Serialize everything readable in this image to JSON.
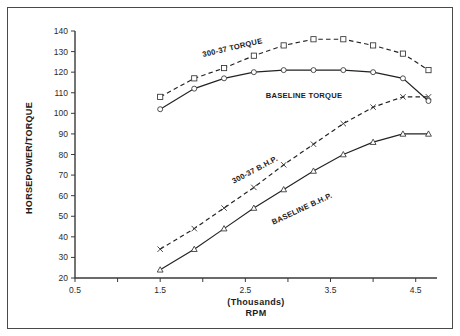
{
  "chart_data": {
    "type": "line",
    "title": "",
    "xlabel": "(Thousands)\nRPM",
    "xlabel_line1": "(Thousands)",
    "xlabel_line2": "RPM",
    "ylabel": "HORSEPOWER/TORQUE",
    "xlim": [
      0.5,
      4.75
    ],
    "ylim": [
      20,
      140
    ],
    "xticks": [
      0.5,
      1.0,
      1.5,
      2.0,
      2.5,
      3.0,
      3.5,
      4.0,
      4.5
    ],
    "xticklabels": [
      "0.5",
      "",
      "1.5",
      "",
      "2.5",
      "",
      "3.5",
      "",
      "4.5"
    ],
    "yticks": [
      20,
      30,
      40,
      50,
      60,
      70,
      80,
      90,
      100,
      110,
      120,
      130,
      140
    ],
    "yticklabels": [
      "20",
      "30",
      "40",
      "50",
      "60",
      "70",
      "80",
      "90",
      "100",
      "110",
      "120",
      "130",
      "140"
    ],
    "grid": false,
    "legend": "inline-annotations",
    "series": [
      {
        "name": "300-37 TORQUE",
        "label": "300-37 TORQUE",
        "style": "dashed",
        "marker": "square",
        "x": [
          1.5,
          1.9,
          2.25,
          2.6,
          2.95,
          3.3,
          3.65,
          4.0,
          4.35,
          4.65
        ],
        "values": [
          108,
          117,
          122,
          128,
          133,
          136,
          136,
          133,
          129,
          121
        ]
      },
      {
        "name": "BASELINE TORQUE",
        "label": "BASELINE TORQUE",
        "style": "solid",
        "marker": "circle",
        "x": [
          1.5,
          1.9,
          2.25,
          2.6,
          2.95,
          3.3,
          3.65,
          4.0,
          4.35,
          4.65
        ],
        "values": [
          102,
          112,
          117,
          120,
          121,
          121,
          121,
          120,
          117,
          106
        ]
      },
      {
        "name": "300-37 B.H.P.",
        "label": "300-37 B.H.P.",
        "style": "dashed",
        "marker": "x",
        "x": [
          1.5,
          1.9,
          2.25,
          2.6,
          2.95,
          3.3,
          3.65,
          4.0,
          4.35,
          4.65
        ],
        "values": [
          34,
          44,
          54,
          64,
          75,
          85,
          95,
          103,
          108,
          108
        ]
      },
      {
        "name": "BASELINE B.H.P.",
        "label": "BASELINE B.H.P.",
        "style": "solid",
        "marker": "triangle",
        "x": [
          1.5,
          1.9,
          2.25,
          2.6,
          2.95,
          3.3,
          3.65,
          4.0,
          4.35,
          4.65
        ],
        "values": [
          24,
          34,
          44,
          54,
          63,
          72,
          80,
          86,
          90,
          90
        ]
      }
    ]
  },
  "annotations": {
    "torque_300_37": "300-37 TORQUE",
    "torque_baseline": "BASELINE TORQUE",
    "bhp_300_37": "300-37 B.H.P.",
    "bhp_baseline": "BASELINE B.H.P."
  },
  "colors": {
    "ink": "#222222",
    "frame": "#4a4a4a",
    "background": "#ffffff"
  }
}
